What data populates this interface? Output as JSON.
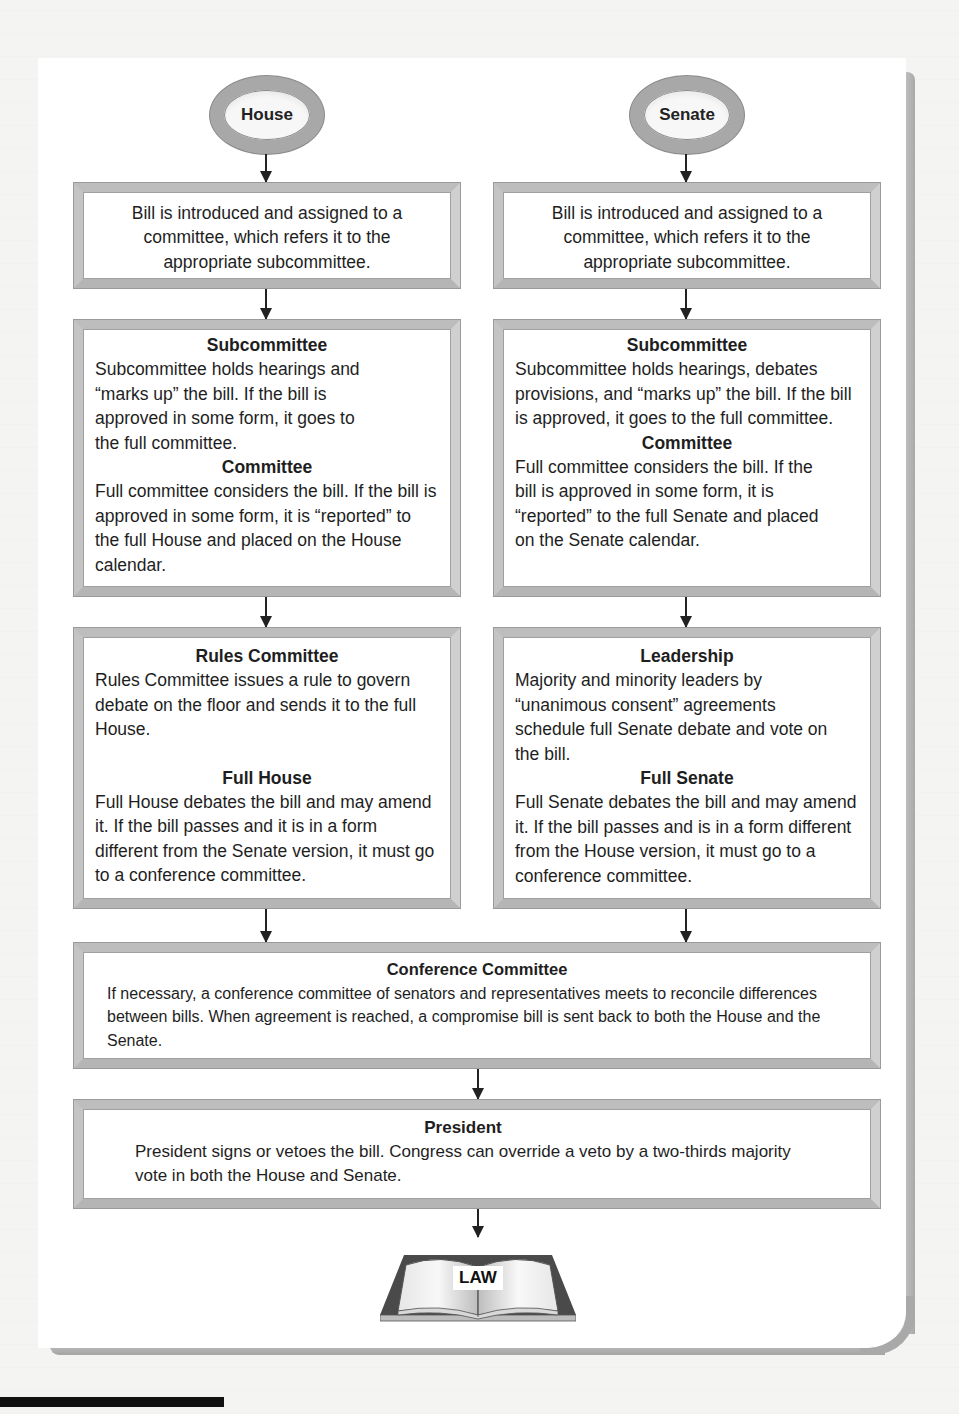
{
  "diagram": {
    "type": "flowchart",
    "origins": {
      "house": "House",
      "senate": "Senate"
    },
    "house_column": {
      "introduction": {
        "line1": "Bill is introduced and assigned to a",
        "line2": "committee, which refers it to the",
        "line3": "appropriate subcommittee."
      },
      "subcommittee": {
        "title": "Subcommittee",
        "text": "Subcommittee holds hearings and “marks up” the bill. If the bill is approved in some form, it goes to the full committee."
      },
      "committee": {
        "title": "Committee",
        "text": "Full committee considers the bill. If the bill is approved in some form, it is “reported” to the full House and placed on the House calendar."
      },
      "rules_committee": {
        "title": "Rules Committee",
        "text": "Rules Committee issues a rule to govern debate on the floor and sends it to the full House."
      },
      "full_chamber": {
        "title": "Full House",
        "text": "Full House debates the bill and may amend it. If the bill passes and it is in a form different from the Senate version, it must go to a conference committee."
      }
    },
    "senate_column": {
      "introduction": {
        "line1": "Bill is introduced and assigned to a",
        "line2": "committee, which refers it to the",
        "line3": "appropriate subcommittee."
      },
      "subcommittee": {
        "title": "Subcommittee",
        "text": "Subcommittee holds hearings, debates provisions, and “marks up” the bill. If the bill is approved, it goes to the full committee."
      },
      "committee": {
        "title": "Committee",
        "text": "Full committee considers the bill. If the bill is approved in some form, it is “reported” to the full Senate and placed on the Senate calendar."
      },
      "leadership": {
        "title": "Leadership",
        "text": "Majority and minority leaders by “unanimous consent” agreements schedule full Senate debate and vote on the bill."
      },
      "full_chamber": {
        "title": "Full Senate",
        "text": "Full Senate debates the bill and may amend it. If the bill passes and is in a form different from the House version, it must go to a conference committee."
      }
    },
    "conference_committee": {
      "title": "Conference Committee",
      "text": "If necessary, a conference committee of senators and representatives meets to reconcile differences between bills. When agreement is reached, a compromise bill is sent back to both the House and the Senate."
    },
    "president": {
      "title": "President",
      "text": "President signs or vetoes the bill. Congress can override a veto by a two-thirds majority vote in both the House and Senate."
    },
    "outcome": {
      "label": "LAW",
      "icon": "open-book-icon"
    }
  },
  "colors": {
    "frame": "#bdbdbd",
    "oval_ring": "#a8a8a8",
    "text": "#1e1e1e",
    "arrow": "#222222",
    "book_cover": "#4a4a4a"
  }
}
